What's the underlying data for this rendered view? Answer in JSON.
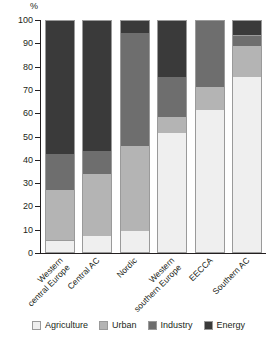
{
  "chart_data": {
    "type": "bar",
    "stacked": true,
    "title": "",
    "xlabel": "",
    "ylabel": "%",
    "ylim": [
      0,
      100
    ],
    "yticks": [
      0,
      10,
      20,
      30,
      40,
      50,
      60,
      70,
      80,
      90,
      100
    ],
    "grid": false,
    "legend_position": "bottom",
    "categories": [
      "Western central Europe",
      "Central AC",
      "Nordic",
      "Western southern Europe",
      "EECCA",
      "Southern AC"
    ],
    "category_lines": [
      [
        "Western",
        "central Europe"
      ],
      [
        "Central AC"
      ],
      [
        "Nordic"
      ],
      [
        "Western",
        "southern Europe"
      ],
      [
        "EECCA"
      ],
      [
        "Southern AC"
      ]
    ],
    "series": [
      {
        "name": "Agriculture",
        "color": "#efefef",
        "values": [
          5,
          7,
          9,
          51,
          61,
          75
        ]
      },
      {
        "name": "Urban",
        "color": "#b4b4b4",
        "values": [
          21.5,
          26.5,
          36.5,
          7,
          10,
          13.5
        ]
      },
      {
        "name": "Industry",
        "color": "#6e6e6e",
        "values": [
          15.5,
          10,
          48.5,
          17,
          29,
          4.5
        ]
      },
      {
        "name": "Energy",
        "color": "#3a3a3a",
        "values": [
          58,
          56.5,
          6,
          25,
          0,
          7
        ]
      }
    ],
    "cumulative_tops": [
      [
        5,
        26.5,
        42,
        100
      ],
      [
        7,
        33.5,
        43.5,
        100
      ],
      [
        9,
        45.5,
        94,
        100
      ],
      [
        51,
        58,
        75,
        100
      ],
      [
        61,
        71,
        100,
        100
      ],
      [
        75,
        88.5,
        93,
        100
      ]
    ]
  },
  "legend": {
    "items": [
      {
        "label": "Agriculture",
        "key": "agriculture"
      },
      {
        "label": "Urban",
        "key": "urban"
      },
      {
        "label": "Industry",
        "key": "industry"
      },
      {
        "label": "Energy",
        "key": "energy"
      }
    ]
  }
}
